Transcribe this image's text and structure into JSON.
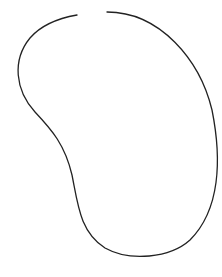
{
  "canvas": {
    "width": 222,
    "height": 277,
    "background": "#ffffff"
  },
  "shape": {
    "type": "open-bean-curve",
    "stroke": "#222222",
    "stroke_width": 1.3,
    "path": "M 107 12 C 160 12, 200 60, 212 110 C 222 160, 220 210, 190 240 C 170 258, 130 262, 105 248 C 80 232, 78 205, 72 175 C 65 145, 52 130, 35 112 C 15 90, 12 60, 30 38 C 42 24, 60 18, 77 15"
  }
}
